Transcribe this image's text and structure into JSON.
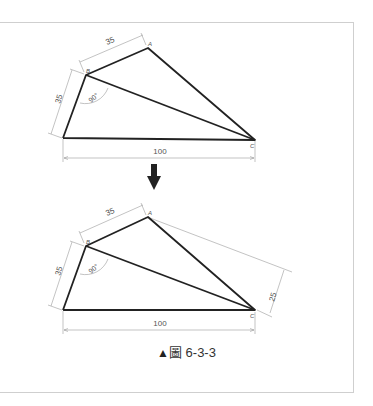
{
  "figure": {
    "caption_marker": "▲",
    "caption_char": "圖",
    "caption_number": "6-3-3",
    "colors": {
      "outline": "#222222",
      "dimension": "#9a9a9a",
      "frame": "#cfcfcf"
    }
  },
  "top_diagram": {
    "vertices": {
      "A": "A",
      "B": "B",
      "C": "C"
    },
    "dim_ab": "35",
    "dim_b_left": "35",
    "dim_bottom": "100",
    "angle_label": "90°"
  },
  "transition": {
    "icon": "down-arrow-icon"
  },
  "bottom_diagram": {
    "vertices": {
      "A": "A",
      "B": "B",
      "C": "C"
    },
    "dim_ab": "35",
    "dim_b_left": "35",
    "dim_bottom": "100",
    "angle_label": "90°",
    "dim_ac_offset": "25"
  }
}
